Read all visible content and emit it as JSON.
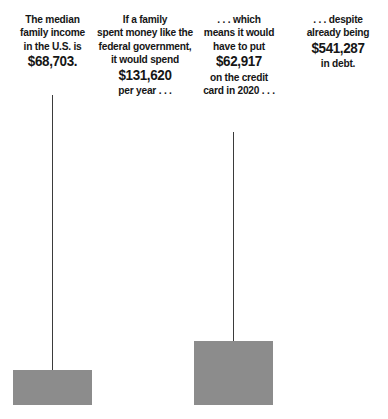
{
  "chart_data": {
    "type": "bar",
    "title": "",
    "subtitle": "",
    "xlabel": "",
    "ylabel": "",
    "grid": false,
    "legend": null,
    "categories": [
      "Median U.S. family income",
      "Family spending like the federal government",
      "Amount put on the credit card in 2020",
      "Existing debt"
    ],
    "values": [
      68703,
      131620,
      62917,
      541287
    ],
    "value_labels": [
      "$68,703",
      "$131,620",
      "$62,917",
      "$541,287"
    ],
    "series": [
      {
        "name": "Dollars",
        "values": [
          68703,
          131620,
          62917,
          541287
        ]
      }
    ],
    "bar_colors": [
      "#8c8c8c",
      "#8c8c8c",
      "#8c8c8c",
      "#262626"
    ],
    "ylim": [
      0,
      541287
    ],
    "annotations": [
      "The median family income in the U.S. is $68,703.",
      "If a family spent money like the federal government, it would spend $131,620 per year . . .",
      ". . . which means it would have to put $62,917 on the credit card in 2020 . . .",
      ". . . despite already being $541,287 in debt."
    ]
  },
  "colors": {
    "background": "#ffffff",
    "bar_light": "#8c8c8c",
    "bar_dark": "#262626",
    "stem": "#3b3b3b",
    "text": "#161616"
  },
  "columns": [
    {
      "id": "median-income",
      "lines": [
        "The median",
        "family income",
        "in the U.S. is"
      ],
      "amount": "$68,703.",
      "amount_position": "end",
      "trailing_lines": []
    },
    {
      "id": "federal-spending",
      "lines": [
        "If a family",
        "spent money like the",
        "federal government,",
        "it would spend"
      ],
      "amount": "$131,620",
      "amount_position": "middle",
      "trailing_lines": [
        "per year . . ."
      ]
    },
    {
      "id": "credit-card",
      "lines": [
        ". . . which",
        "means it would",
        "have to put"
      ],
      "amount": "$62,917",
      "amount_position": "middle",
      "trailing_lines": [
        "on the credit",
        "card in 2020 . . ."
      ]
    },
    {
      "id": "existing-debt",
      "lines": [
        ". . . despite",
        "already being"
      ],
      "amount": "$541,287",
      "amount_position": "middle",
      "trailing_lines": [
        "in debt."
      ]
    }
  ]
}
